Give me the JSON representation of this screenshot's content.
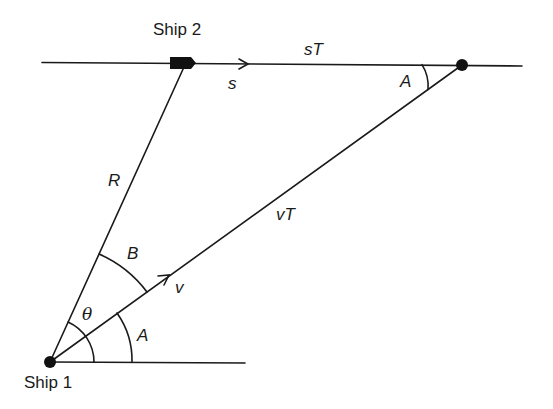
{
  "diagram": {
    "colors": {
      "stroke": "#1a1a1a",
      "background": "#ffffff"
    },
    "nodes": {
      "ship1": {
        "label": "Ship 1",
        "x": 50,
        "y": 362,
        "shape": "dot"
      },
      "ship2": {
        "label": "Ship 2",
        "x": 182,
        "y": 63,
        "shape": "ship-marker"
      },
      "meeting_point": {
        "label": "",
        "x": 462,
        "y": 65,
        "shape": "dot"
      }
    },
    "edges": [
      {
        "id": "ship2-track",
        "from": [
          42,
          62
        ],
        "to": [
          522,
          66
        ],
        "label": "sT"
      },
      {
        "id": "range-line",
        "from": "ship1",
        "to": "ship2",
        "label": "R"
      },
      {
        "id": "ship1-path",
        "from": "ship1",
        "to": "meeting_point",
        "label": "vT"
      },
      {
        "id": "baseline",
        "from": "ship1",
        "to": [
          245,
          363
        ],
        "label": ""
      }
    ],
    "labels": {
      "ship1": "Ship 1",
      "ship2": "Ship 2",
      "sT": "sT",
      "s": "s",
      "R": "R",
      "vT": "vT",
      "v": "v",
      "B": "B",
      "theta": "θ",
      "A_bottom": "A",
      "A_top": "A"
    },
    "angles": [
      {
        "name": "theta",
        "vertex": "ship1",
        "between": [
          "baseline",
          "range-line"
        ]
      },
      {
        "name": "A",
        "vertex": "ship1",
        "between": [
          "baseline",
          "ship1-path"
        ]
      },
      {
        "name": "B",
        "vertex": "ship1",
        "between": [
          "ship1-path",
          "range-line"
        ]
      },
      {
        "name": "A",
        "vertex": "meeting_point",
        "between": [
          "ship2-track",
          "ship1-path"
        ]
      }
    ],
    "arrows": [
      {
        "name": "s-velocity-arrow",
        "on": "ship2-track",
        "at": [
          247,
          64
        ]
      },
      {
        "name": "v-velocity-arrow",
        "on": "ship1-path",
        "at": [
          168,
          276
        ]
      }
    ]
  }
}
